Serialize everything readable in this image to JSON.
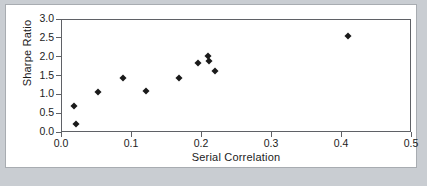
{
  "figure": {
    "background_color": "#c9cdd2",
    "card_color": "#ffffff",
    "axis_color": "#5f6166",
    "marker_color": "#1a1a1a"
  },
  "chart_data": {
    "type": "scatter",
    "title": "",
    "xlabel": "Serial Correlation",
    "ylabel": "Sharpe Ratio",
    "xlim": [
      0.0,
      0.5
    ],
    "ylim": [
      0.0,
      3.0
    ],
    "xticks": [
      0.0,
      0.1,
      0.2,
      0.3,
      0.4,
      0.5
    ],
    "xtick_labels": [
      "0.0",
      "0.1",
      "0.2",
      "0.3",
      "0.4",
      "0.5"
    ],
    "yticks": [
      0.0,
      0.5,
      1.0,
      1.5,
      2.0,
      2.5,
      3.0
    ],
    "ytick_labels": [
      "0.0",
      "0.5",
      "1.0",
      "1.5",
      "2.0",
      "2.5",
      "3.0"
    ],
    "grid": false,
    "legend": null,
    "marker": "diamond",
    "points": [
      {
        "x": 0.019,
        "y": 0.69
      },
      {
        "x": 0.022,
        "y": 0.21
      },
      {
        "x": 0.053,
        "y": 1.06
      },
      {
        "x": 0.088,
        "y": 1.44
      },
      {
        "x": 0.121,
        "y": 1.08
      },
      {
        "x": 0.169,
        "y": 1.43
      },
      {
        "x": 0.196,
        "y": 1.84
      },
      {
        "x": 0.21,
        "y": 2.02
      },
      {
        "x": 0.212,
        "y": 1.88
      },
      {
        "x": 0.22,
        "y": 1.63
      },
      {
        "x": 0.41,
        "y": 2.55
      }
    ]
  }
}
